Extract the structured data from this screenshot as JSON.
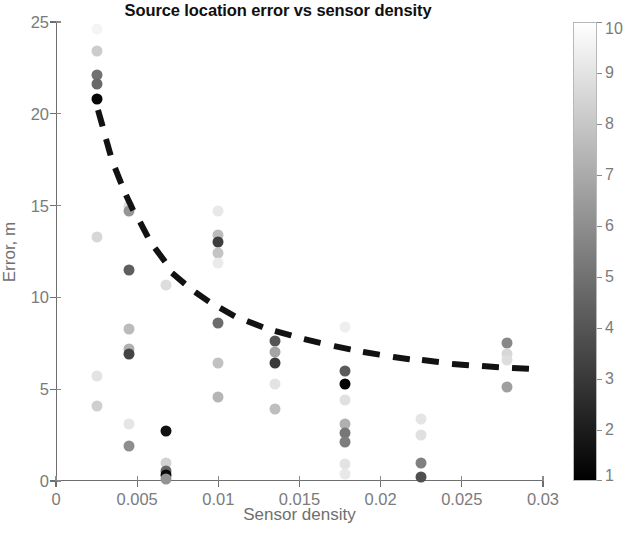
{
  "chart_data": {
    "type": "scatter",
    "title": "Source location error vs sensor density",
    "xlabel": "Sensor density",
    "ylabel": "Error, m",
    "xlim": [
      0,
      0.03
    ],
    "ylim": [
      0,
      25
    ],
    "xticks": [
      0,
      0.005,
      0.01,
      0.015,
      0.02,
      0.025,
      0.03
    ],
    "xticklabels": [
      "0",
      "0.005",
      "0.01",
      "0.015",
      "0.02",
      "0.025",
      "0.03"
    ],
    "yticks": [
      0,
      5,
      10,
      15,
      20,
      25
    ],
    "yticklabels": [
      "0",
      "5",
      "10",
      "15",
      "20",
      "25"
    ],
    "grid": false,
    "legend": null,
    "colorbar": {
      "label": "",
      "min": 1,
      "max": 10,
      "ticks": [
        1,
        2,
        3,
        4,
        5,
        6,
        7,
        8,
        9,
        10
      ],
      "ticklabels": [
        "1",
        "2",
        "3",
        "4",
        "5",
        "6",
        "7",
        "8",
        "9",
        "10"
      ],
      "colormap": "gray",
      "low_color": "#000000",
      "high_color": "#ffffff",
      "position": "right"
    },
    "marker": "filled-circle",
    "points": [
      {
        "x": 0.0025,
        "y": 24.6,
        "c": 9.6
      },
      {
        "x": 0.0025,
        "y": 23.4,
        "c": 8.2
      },
      {
        "x": 0.0025,
        "y": 22.1,
        "c": 5.0
      },
      {
        "x": 0.0025,
        "y": 21.6,
        "c": 4.7
      },
      {
        "x": 0.0025,
        "y": 20.8,
        "c": 1.2
      },
      {
        "x": 0.0025,
        "y": 13.3,
        "c": 8.6
      },
      {
        "x": 0.0025,
        "y": 5.7,
        "c": 9.0
      },
      {
        "x": 0.0025,
        "y": 4.1,
        "c": 8.3
      },
      {
        "x": 0.0045,
        "y": 15.0,
        "c": 8.8
      },
      {
        "x": 0.0045,
        "y": 14.7,
        "c": 6.3
      },
      {
        "x": 0.0045,
        "y": 11.5,
        "c": 4.3
      },
      {
        "x": 0.0045,
        "y": 8.3,
        "c": 7.6
      },
      {
        "x": 0.0045,
        "y": 7.2,
        "c": 7.2
      },
      {
        "x": 0.0045,
        "y": 6.9,
        "c": 3.4
      },
      {
        "x": 0.0045,
        "y": 3.1,
        "c": 9.1
      },
      {
        "x": 0.0045,
        "y": 1.9,
        "c": 6.0
      },
      {
        "x": 0.0068,
        "y": 10.7,
        "c": 8.8
      },
      {
        "x": 0.0068,
        "y": 2.7,
        "c": 1.6
      },
      {
        "x": 0.0068,
        "y": 1.0,
        "c": 8.4
      },
      {
        "x": 0.0068,
        "y": 0.55,
        "c": 4.6
      },
      {
        "x": 0.0068,
        "y": 0.3,
        "c": 1.3
      },
      {
        "x": 0.0068,
        "y": 0.1,
        "c": 6.2
      },
      {
        "x": 0.01,
        "y": 14.7,
        "c": 9.2
      },
      {
        "x": 0.01,
        "y": 13.4,
        "c": 7.6
      },
      {
        "x": 0.01,
        "y": 13.0,
        "c": 3.2
      },
      {
        "x": 0.01,
        "y": 12.4,
        "c": 7.9
      },
      {
        "x": 0.01,
        "y": 11.9,
        "c": 9.3
      },
      {
        "x": 0.01,
        "y": 8.6,
        "c": 4.8
      },
      {
        "x": 0.01,
        "y": 6.4,
        "c": 7.8
      },
      {
        "x": 0.01,
        "y": 4.6,
        "c": 7.4
      },
      {
        "x": 0.0135,
        "y": 7.6,
        "c": 4.0
      },
      {
        "x": 0.0135,
        "y": 7.0,
        "c": 6.8
      },
      {
        "x": 0.0135,
        "y": 6.4,
        "c": 3.0
      },
      {
        "x": 0.0135,
        "y": 5.3,
        "c": 9.0
      },
      {
        "x": 0.0135,
        "y": 3.9,
        "c": 7.7
      },
      {
        "x": 0.0178,
        "y": 6.0,
        "c": 4.2
      },
      {
        "x": 0.0178,
        "y": 5.3,
        "c": 1.1
      },
      {
        "x": 0.0178,
        "y": 4.4,
        "c": 8.9
      },
      {
        "x": 0.0178,
        "y": 3.1,
        "c": 7.2
      },
      {
        "x": 0.0178,
        "y": 2.6,
        "c": 5.2
      },
      {
        "x": 0.0178,
        "y": 2.1,
        "c": 5.4
      },
      {
        "x": 0.0178,
        "y": 0.9,
        "c": 9.0
      },
      {
        "x": 0.0178,
        "y": 0.4,
        "c": 9.2
      },
      {
        "x": 0.0178,
        "y": 8.4,
        "c": 9.4
      },
      {
        "x": 0.0225,
        "y": 3.4,
        "c": 9.1
      },
      {
        "x": 0.0225,
        "y": 2.5,
        "c": 8.9
      },
      {
        "x": 0.0225,
        "y": 1.0,
        "c": 5.5
      },
      {
        "x": 0.0225,
        "y": 0.2,
        "c": 3.8
      },
      {
        "x": 0.0278,
        "y": 7.5,
        "c": 5.8
      },
      {
        "x": 0.0278,
        "y": 6.9,
        "c": 8.6
      },
      {
        "x": 0.0278,
        "y": 6.6,
        "c": 8.8
      },
      {
        "x": 0.0278,
        "y": 5.1,
        "c": 6.6
      }
    ],
    "trendline": {
      "style": "dashed",
      "color": "#121212",
      "width": 6,
      "description": "decaying power-law fit",
      "x": [
        0.0026,
        0.0035,
        0.0045,
        0.0058,
        0.0072,
        0.009,
        0.011,
        0.0133,
        0.0158,
        0.0185,
        0.0213,
        0.0242,
        0.0272,
        0.0296
      ],
      "y": [
        20.2,
        17.4,
        15.2,
        13.0,
        11.3,
        10.0,
        9.0,
        8.2,
        7.6,
        7.1,
        6.7,
        6.4,
        6.2,
        6.1
      ]
    }
  }
}
